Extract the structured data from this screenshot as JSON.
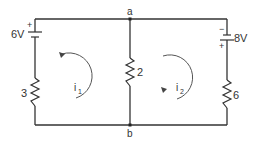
{
  "diagram": {
    "type": "two-mesh DC circuit",
    "nodes": [
      {
        "id": "a",
        "label": "a"
      },
      {
        "id": "b",
        "label": "b"
      }
    ],
    "sources": [
      {
        "id": "V1",
        "label": "6V",
        "value": 6,
        "unit": "V",
        "branch": "left",
        "positive_terminal": "top",
        "plus_sign": "+"
      },
      {
        "id": "V2",
        "label": "8V",
        "value": 8,
        "unit": "V",
        "branch": "right",
        "positive_terminal": "bottom",
        "plus_sign": "+",
        "minus_sign": "−"
      }
    ],
    "resistors": [
      {
        "id": "R1",
        "label": "3",
        "value": 3,
        "branch": "left"
      },
      {
        "id": "R2",
        "label": "2",
        "value": 2,
        "branch": "middle"
      },
      {
        "id": "R3",
        "label": "6",
        "value": 6,
        "branch": "right"
      }
    ],
    "mesh_currents": [
      {
        "id": "i1",
        "symbol": "i",
        "subscript": "1",
        "direction": "clockwise",
        "loop": "left"
      },
      {
        "id": "i2",
        "symbol": "i",
        "subscript": "2",
        "direction": "clockwise",
        "loop": "right"
      }
    ],
    "colors": {
      "line": "#333333",
      "background": "#ffffff"
    }
  }
}
